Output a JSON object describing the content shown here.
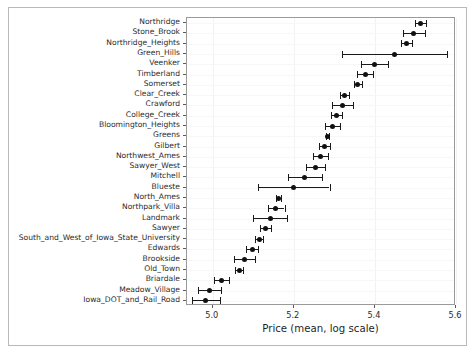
{
  "figure": {
    "width": 476,
    "height": 354,
    "background": "#ffffff",
    "frame_color": "#b9b9b9",
    "axis_color": "#9a9a9a",
    "marker_color": "#101010"
  },
  "chart_data": {
    "type": "scatter",
    "orientation": "horizontal",
    "title": "",
    "xlabel": "Price (mean, log scale)",
    "ylabel": "",
    "xlim": [
      4.9365,
      5.6
    ],
    "xticks": [
      5.0,
      5.2,
      5.4,
      5.6
    ],
    "xticklabels": [
      "5.0",
      "5.2",
      "5.4",
      "5.6"
    ],
    "grid": false,
    "legend": null,
    "error_bars": "confidence interval (horizontal)",
    "categories": [
      "Northridge",
      "Stone_Brook",
      "Northridge_Heights",
      "Green_Hills",
      "Veenker",
      "Timberland",
      "Somerset",
      "Clear_Creek",
      "Crawford",
      "College_Creek",
      "Bloomington_Heights",
      "Greens",
      "Gilbert",
      "Northwest_Ames",
      "Sawyer_West",
      "Mitchell",
      "Blueste",
      "North_Ames",
      "Northpark_Villa",
      "Landmark",
      "Sawyer",
      "South_and_West_of_Iowa_State_University",
      "Edwards",
      "Brookside",
      "Old_Town",
      "Briardale",
      "Meadow_Village",
      "Iowa_DOT_and_Rail_Road"
    ],
    "values": [
      5.513,
      5.496,
      5.477,
      5.448,
      5.399,
      5.376,
      5.358,
      5.325,
      5.32,
      5.305,
      5.296,
      5.283,
      5.275,
      5.266,
      5.254,
      5.227,
      5.2,
      5.162,
      5.156,
      5.142,
      5.13,
      5.115,
      5.097,
      5.079,
      5.065,
      5.021,
      4.992,
      4.983
    ],
    "errors_low": [
      5.498,
      5.47,
      5.464,
      5.32,
      5.365,
      5.357,
      5.348,
      5.313,
      5.294,
      5.292,
      5.277,
      5.279,
      5.261,
      5.248,
      5.231,
      5.185,
      5.112,
      5.155,
      5.136,
      5.1,
      5.117,
      5.105,
      5.083,
      5.053,
      5.055,
      5.002,
      4.963,
      4.948
    ],
    "errors_high": [
      5.527,
      5.523,
      5.491,
      5.577,
      5.433,
      5.395,
      5.369,
      5.337,
      5.346,
      5.318,
      5.315,
      5.287,
      5.29,
      5.284,
      5.277,
      5.27,
      5.288,
      5.169,
      5.177,
      5.184,
      5.143,
      5.125,
      5.112,
      5.105,
      5.075,
      5.04,
      5.02,
      5.018
    ]
  }
}
